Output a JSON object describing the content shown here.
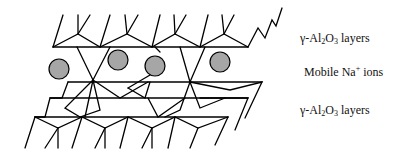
{
  "figure": {
    "labels": {
      "top_layer": {
        "prefix": "γ-Al",
        "sub1": "2",
        "mid": "O",
        "sub2": "3",
        "suffix": " layers"
      },
      "mobile_ions": {
        "prefix": "Mobile Na",
        "sup": "+",
        "suffix": " ions"
      },
      "bottom_layer": {
        "prefix": "γ-Al",
        "sub1": "2",
        "mid": "O",
        "sub2": "3",
        "suffix": " layers"
      }
    },
    "colors": {
      "ion_fill": "#a6a6a6",
      "line": "#000000"
    },
    "ion_count": 4
  }
}
